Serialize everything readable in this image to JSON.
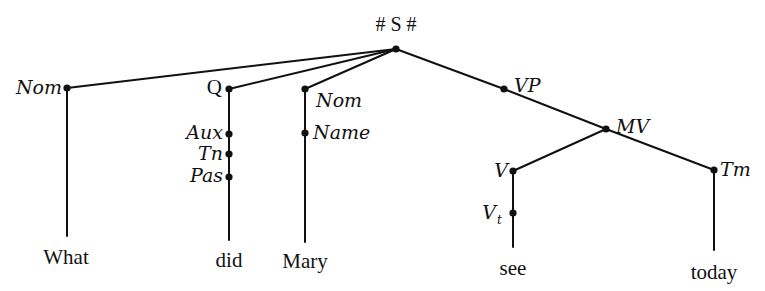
{
  "diagram": {
    "type": "syntax-tree",
    "root": {
      "id": "S",
      "label": "# S #",
      "x": 396,
      "y": 49
    },
    "nodes": [
      {
        "id": "S",
        "label": "# S #",
        "x": 396,
        "y": 49
      },
      {
        "id": "Nom1",
        "label": "Nom",
        "x": 67,
        "y": 88
      },
      {
        "id": "Q",
        "label": "Q",
        "x": 229,
        "y": 89
      },
      {
        "id": "Nom2",
        "label": "Nom",
        "x": 305,
        "y": 89
      },
      {
        "id": "VP",
        "label": "VP",
        "x": 504,
        "y": 89
      },
      {
        "id": "Aux",
        "label": "Aux",
        "x": 229,
        "y": 134
      },
      {
        "id": "Tn",
        "label": "Tn",
        "x": 229,
        "y": 154
      },
      {
        "id": "Pas",
        "label": "Pas",
        "x": 229,
        "y": 177
      },
      {
        "id": "Name",
        "label": "Name",
        "x": 305,
        "y": 133
      },
      {
        "id": "MV",
        "label": "MV",
        "x": 606,
        "y": 129
      },
      {
        "id": "V",
        "label": "V",
        "x": 513,
        "y": 171
      },
      {
        "id": "Vt",
        "label": "V",
        "subscript": "t",
        "x": 513,
        "y": 213
      },
      {
        "id": "Tm",
        "label": "Tm",
        "x": 714,
        "y": 170
      }
    ],
    "edges": [
      [
        "S",
        "Nom1"
      ],
      [
        "S",
        "Q"
      ],
      [
        "S",
        "Nom2"
      ],
      [
        "S",
        "VP"
      ],
      [
        "VP",
        "MV"
      ],
      [
        "MV",
        "V"
      ],
      [
        "MV",
        "Tm"
      ],
      [
        "Q",
        "Aux"
      ],
      [
        "Aux",
        "Tn"
      ],
      [
        "Tn",
        "Pas"
      ],
      [
        "Nom2",
        "Name"
      ],
      [
        "V",
        "Vt"
      ]
    ],
    "terminals": [
      {
        "word": "What",
        "parent": "Nom1"
      },
      {
        "word": "did",
        "parent": "Pas"
      },
      {
        "word": "Mary",
        "parent": "Name"
      },
      {
        "word": "see",
        "parent": "Vt"
      },
      {
        "word": "today",
        "parent": "Tm"
      }
    ]
  },
  "labels": {
    "root": "# S #",
    "nom1": "Nom",
    "q": "Q",
    "nom2": "Nom",
    "name": "Name",
    "aux": "Aux",
    "tn": "Tn",
    "pas": "Pas",
    "vp": "VP",
    "mv": "MV",
    "v": "V",
    "vt_base": "V",
    "vt_sub": "t",
    "tm": "Tm"
  },
  "words": {
    "what": "What",
    "did": "did",
    "mary": "Mary",
    "see": "see",
    "today": "today"
  }
}
